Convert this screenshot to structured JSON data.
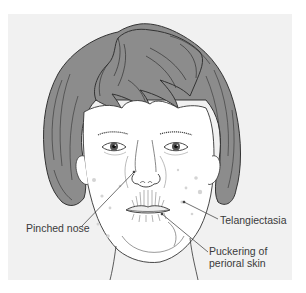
{
  "figure": {
    "colors": {
      "panel_background": "#f1f1f1",
      "hair": "#8c8c8c",
      "hair_shadow": "#6e6e6e",
      "skin": "#ffffff",
      "line": "#333333",
      "telangiectasia_spot": "#d8d8d8"
    },
    "labels": [
      {
        "id": "pinched-nose",
        "text": "Pinched nose"
      },
      {
        "id": "telangiectasia",
        "text": "Telangiectasia"
      },
      {
        "id": "puckering",
        "lines": [
          "Puckering of",
          "perioral skin"
        ]
      }
    ]
  }
}
